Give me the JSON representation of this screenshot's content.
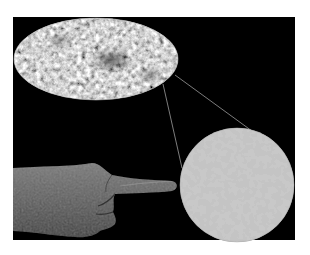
{
  "image": {
    "description": "Full-sky microwave background map (elliptical projection) with a magnified circular patch, a human hand pointing at the patch",
    "background_color": "#ffffff",
    "panel_color": "#000000"
  },
  "elements": {
    "sky_map": {
      "shape": "ellipse",
      "cx": 96,
      "cy": 59,
      "rx": 82,
      "ry": 41,
      "tone": "mottled gray"
    },
    "zoom_lines": [
      {
        "x1": 175,
        "y1": 75,
        "x2": 252,
        "y2": 131
      },
      {
        "x1": 163,
        "y1": 84,
        "x2": 182,
        "y2": 168
      }
    ],
    "magnified_patch": {
      "shape": "circle",
      "cx": 237,
      "cy": 185,
      "r": 57,
      "tone": "gray with white and dark speckles"
    },
    "hand": {
      "pose": "index finger pointing right",
      "tone": "dark gray"
    }
  }
}
